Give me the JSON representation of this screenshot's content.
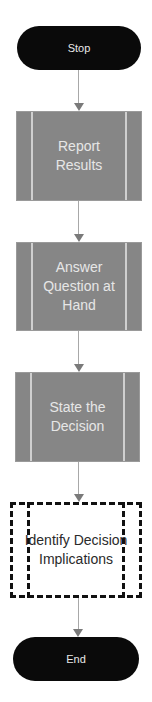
{
  "flowchart": {
    "nodes": [
      {
        "id": "stop",
        "type": "terminal",
        "label": "Stop"
      },
      {
        "id": "report",
        "type": "process",
        "label": "Report Results"
      },
      {
        "id": "answer",
        "type": "process",
        "label": "Answer Question at Hand"
      },
      {
        "id": "state",
        "type": "process",
        "label": "State the Decision"
      },
      {
        "id": "identify",
        "type": "process-highlighted",
        "label": "Identify Decision Implications"
      },
      {
        "id": "end",
        "type": "terminal",
        "label": "End"
      }
    ],
    "edges": [
      {
        "from": "stop",
        "to": "report"
      },
      {
        "from": "report",
        "to": "answer"
      },
      {
        "from": "answer",
        "to": "state"
      },
      {
        "from": "state",
        "to": "identify"
      },
      {
        "from": "identify",
        "to": "end"
      }
    ],
    "colors": {
      "terminal_fill": "#0a0a0a",
      "terminal_text": "#e8e8e8",
      "process_fill": "#868686",
      "process_text": "#e6e6e6",
      "highlight_border": "#111111",
      "connector": "#a8a8a8",
      "arrowhead": "#7a7a7a"
    }
  }
}
